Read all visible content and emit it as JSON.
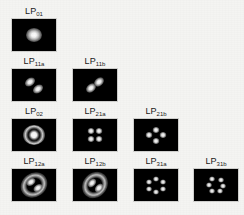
{
  "figure": {
    "background_color": "#f4f4f2",
    "panel_background": "#000000",
    "panel_border_color": "#cfcfcd",
    "label_color": "#1a1a1a",
    "beam_color": "#ffffff"
  },
  "rows": [
    {
      "row_index": 1,
      "panels": [
        {
          "prefix": "LP",
          "subscript": "01",
          "label": "LP01",
          "pattern": "single-gaussian-spot",
          "lobe_count": 1
        }
      ]
    },
    {
      "row_index": 2,
      "panels": [
        {
          "prefix": "LP",
          "subscript": "11a",
          "label": "LP11a",
          "pattern": "two-lobe-diagonal",
          "lobe_count": 2
        },
        {
          "prefix": "LP",
          "subscript": "11b",
          "label": "LP11b",
          "pattern": "two-lobe-diagonal",
          "lobe_count": 2
        }
      ]
    },
    {
      "row_index": 3,
      "panels": [
        {
          "prefix": "LP",
          "subscript": "02",
          "label": "LP02",
          "pattern": "core-with-ring",
          "lobe_count": 1
        },
        {
          "prefix": "LP",
          "subscript": "21a",
          "label": "LP21a",
          "pattern": "four-lobe-square",
          "lobe_count": 4
        },
        {
          "prefix": "LP",
          "subscript": "21b",
          "label": "LP21b",
          "pattern": "four-lobe-diamond",
          "lobe_count": 4
        }
      ]
    },
    {
      "row_index": 4,
      "panels": [
        {
          "prefix": "LP",
          "subscript": "12a",
          "label": "LP12a",
          "pattern": "two-lobe-core-with-arcs",
          "lobe_count": 2
        },
        {
          "prefix": "LP",
          "subscript": "12b",
          "label": "LP12b",
          "pattern": "two-lobe-core-with-arcs",
          "lobe_count": 2
        },
        {
          "prefix": "LP",
          "subscript": "31a",
          "label": "LP31a",
          "pattern": "six-lobe-ring",
          "lobe_count": 6
        },
        {
          "prefix": "LP",
          "subscript": "31b",
          "label": "LP31b",
          "pattern": "six-lobe-ring",
          "lobe_count": 6
        }
      ]
    }
  ]
}
